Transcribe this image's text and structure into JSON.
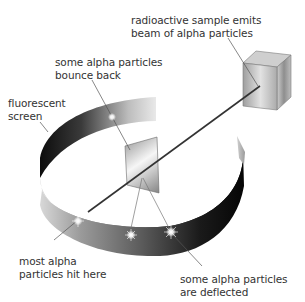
{
  "diagram": {
    "labels": {
      "source": {
        "line1": "radioactive sample emits",
        "line2": "beam of alpha particles"
      },
      "bounce": {
        "line1": "some alpha particles",
        "line2": "bounce back"
      },
      "screen": {
        "line1": "fluorescent",
        "line2": "screen"
      },
      "most": {
        "line1": "most alpha",
        "line2": "particles hit here"
      },
      "deflected": {
        "line1": "some alpha particles",
        "line2": "are deflected"
      }
    },
    "components": [
      "radioactive sample (cube)",
      "alpha particle beam",
      "gold foil",
      "fluorescent screen (ring)",
      "scintillation flashes"
    ],
    "colors": {
      "text": "#333333",
      "beam": "#333333",
      "leader": "#555555",
      "ring_dark": "#111111",
      "ring_light": "#e6e6e6"
    }
  }
}
